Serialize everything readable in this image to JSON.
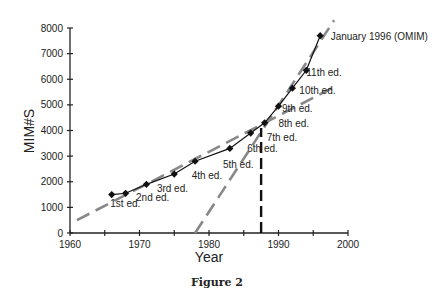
{
  "chart_data": {
    "type": "line",
    "title": "",
    "caption": "Figure 2",
    "xlabel": "Year",
    "ylabel": "MIM#S",
    "xlim": [
      1960,
      2000
    ],
    "ylim": [
      0,
      8000
    ],
    "x_ticks": [
      1960,
      1965,
      1970,
      1975,
      1980,
      1985,
      1990,
      1995,
      2000
    ],
    "x_tick_labels": [
      "1960",
      "",
      "1970",
      "",
      "1980",
      "",
      "1990",
      "",
      "2000"
    ],
    "y_ticks": [
      0,
      1000,
      2000,
      3000,
      4000,
      5000,
      6000,
      7000,
      8000
    ],
    "y_tick_labels": [
      "0",
      "1000",
      "2000",
      "3000",
      "4000",
      "5000",
      "6000",
      "7000",
      "8000"
    ],
    "grid": false,
    "series": [
      {
        "name": "MIM entries",
        "style": "solid-line-diamond-markers",
        "color": "#111111",
        "x": [
          1966,
          1968,
          1971,
          1975,
          1978,
          1983,
          1986,
          1988,
          1990,
          1992,
          1994,
          1996
        ],
        "y": [
          1500,
          1550,
          1900,
          2300,
          2800,
          3300,
          3900,
          4300,
          4950,
          5650,
          6350,
          7700
        ]
      },
      {
        "name": "Early trend (linear)",
        "style": "dashed",
        "color": "#888888",
        "x": [
          1961,
          1998
        ],
        "y": [
          500,
          5700
        ]
      },
      {
        "name": "Late trend (linear)",
        "style": "dashed",
        "color": "#888888",
        "x": [
          1978,
          1998
        ],
        "y": [
          0,
          8300
        ]
      },
      {
        "name": "Transition marker",
        "style": "vertical-dashed",
        "color": "#111111",
        "x": [
          1987.5,
          1987.5
        ],
        "y": [
          0,
          4100
        ]
      }
    ],
    "annotations": [
      {
        "text": "1st ed.",
        "x": 1965.8,
        "y": 1000
      },
      {
        "text": "2nd ed.",
        "x": 1969.5,
        "y": 1250
      },
      {
        "text": "3rd ed.",
        "x": 1972.5,
        "y": 1600
      },
      {
        "text": "4th ed.",
        "x": 1977.5,
        "y": 2100
      },
      {
        "text": "5th ed.",
        "x": 1982,
        "y": 2550
      },
      {
        "text": "6th ed.",
        "x": 1985.5,
        "y": 3170
      },
      {
        "text": "7th ed.",
        "x": 1988.3,
        "y": 3600
      },
      {
        "text": "8th ed.",
        "x": 1990,
        "y": 4140
      },
      {
        "text": "9th ed.",
        "x": 1990.5,
        "y": 4720
      },
      {
        "text": "10th ed.",
        "x": 1993,
        "y": 5430
      },
      {
        "text": "11th ed.",
        "x": 1994,
        "y": 6130
      },
      {
        "text": "January 1996 (OMIM)",
        "x": 1997.5,
        "y": 7550
      }
    ]
  }
}
